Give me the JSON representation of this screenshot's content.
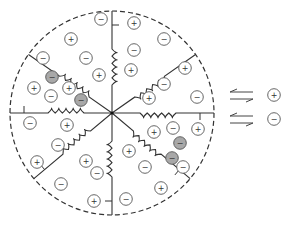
{
  "diagram": {
    "title": "",
    "colors": {
      "stroke": "#333333",
      "ion_stroke": "#555555",
      "bound_ion_fill": "#a8a8a8",
      "background": "#ffffff"
    },
    "boundary": {
      "cx": 112,
      "cy": 113,
      "r": 102,
      "style": "dashed"
    },
    "center": {
      "x": 112,
      "y": 113
    },
    "arms": [
      {
        "name": "arm-north",
        "angle": -90,
        "spring": true
      },
      {
        "name": "arm-northeast",
        "angle": -35,
        "spring": true
      },
      {
        "name": "arm-east",
        "angle": 0,
        "spring": true
      },
      {
        "name": "arm-southeast",
        "angle": 40,
        "spring": true
      },
      {
        "name": "arm-south",
        "angle": 90,
        "spring": true
      },
      {
        "name": "arm-southwest",
        "angle": 140,
        "spring": true
      },
      {
        "name": "arm-west",
        "angle": 180,
        "spring": true
      },
      {
        "name": "arm-northwest",
        "angle": 215,
        "spring": true
      }
    ],
    "ions": [
      {
        "x": 101,
        "y": 19,
        "sign": "−",
        "bound": false
      },
      {
        "x": 134,
        "y": 23,
        "sign": "+",
        "bound": false
      },
      {
        "x": 71,
        "y": 39,
        "sign": "+",
        "bound": false
      },
      {
        "x": 164,
        "y": 39,
        "sign": "−",
        "bound": false
      },
      {
        "x": 134,
        "y": 50,
        "sign": "−",
        "bound": false
      },
      {
        "x": 43,
        "y": 58,
        "sign": "−",
        "bound": false
      },
      {
        "x": 86,
        "y": 58,
        "sign": "−",
        "bound": false
      },
      {
        "x": 185,
        "y": 68,
        "sign": "+",
        "bound": false
      },
      {
        "x": 99,
        "y": 75,
        "sign": "+",
        "bound": false
      },
      {
        "x": 131,
        "y": 70,
        "sign": "+",
        "bound": false
      },
      {
        "x": 52,
        "y": 77,
        "sign": "−",
        "bound": true
      },
      {
        "x": 164,
        "y": 84,
        "sign": "−",
        "bound": false
      },
      {
        "x": 34,
        "y": 88,
        "sign": "+",
        "bound": false
      },
      {
        "x": 69,
        "y": 88,
        "sign": "+",
        "bound": false
      },
      {
        "x": 51,
        "y": 96,
        "sign": "−",
        "bound": false
      },
      {
        "x": 81,
        "y": 100,
        "sign": "−",
        "bound": true
      },
      {
        "x": 149,
        "y": 98,
        "sign": "+",
        "bound": false
      },
      {
        "x": 197,
        "y": 97,
        "sign": "−",
        "bound": false
      },
      {
        "x": 30,
        "y": 123,
        "sign": "−",
        "bound": false
      },
      {
        "x": 67,
        "y": 125,
        "sign": "+",
        "bound": false
      },
      {
        "x": 154,
        "y": 132,
        "sign": "+",
        "bound": false
      },
      {
        "x": 173,
        "y": 128,
        "sign": "−",
        "bound": false
      },
      {
        "x": 198,
        "y": 129,
        "sign": "+",
        "bound": false
      },
      {
        "x": 58,
        "y": 145,
        "sign": "−",
        "bound": false
      },
      {
        "x": 180,
        "y": 143,
        "sign": "−",
        "bound": true
      },
      {
        "x": 129,
        "y": 151,
        "sign": "+",
        "bound": false
      },
      {
        "x": 37,
        "y": 162,
        "sign": "+",
        "bound": false
      },
      {
        "x": 86,
        "y": 161,
        "sign": "+",
        "bound": false
      },
      {
        "x": 172,
        "y": 158,
        "sign": "−",
        "bound": true
      },
      {
        "x": 145,
        "y": 167,
        "sign": "−",
        "bound": false
      },
      {
        "x": 183,
        "y": 167,
        "sign": "−",
        "bound": false
      },
      {
        "x": 97,
        "y": 173,
        "sign": "−",
        "bound": false
      },
      {
        "x": 61,
        "y": 184,
        "sign": "−",
        "bound": false
      },
      {
        "x": 161,
        "y": 188,
        "sign": "+",
        "bound": false
      },
      {
        "x": 94,
        "y": 201,
        "sign": "+",
        "bound": false
      },
      {
        "x": 126,
        "y": 199,
        "sign": "−",
        "bound": false
      }
    ],
    "legend": [
      {
        "arrows": "⇆",
        "sign": "+",
        "label": "cation"
      },
      {
        "arrows": "⇆",
        "sign": "−",
        "label": "anion"
      }
    ]
  }
}
